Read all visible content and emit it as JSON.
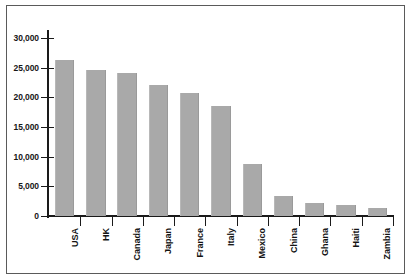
{
  "chart_data": {
    "type": "bar",
    "title": "",
    "subtitle": "",
    "xlabel": "",
    "ylabel": "",
    "categories": [
      "USA",
      "HK",
      "Canada",
      "Japan",
      "France",
      "Italy",
      "Mexico",
      "China",
      "Ghana",
      "Haiti",
      "Zambia"
    ],
    "values": [
      26300,
      24600,
      24100,
      22100,
      20700,
      18500,
      8800,
      3400,
      2200,
      1800,
      1400
    ],
    "series": [
      {
        "name": "",
        "values": [
          26300,
          24600,
          24100,
          22100,
          20700,
          18500,
          8800,
          3400,
          2200,
          1800,
          1400
        ]
      }
    ],
    "ylim": [
      0,
      32000
    ],
    "ytick_values": [
      0,
      5000,
      10000,
      15000,
      20000,
      25000,
      30000
    ],
    "ytick_labels": [
      "0",
      "5,000",
      "10,000",
      "15,000",
      "20,000",
      "25,000",
      "30,000"
    ],
    "grid": false,
    "legend": false,
    "legend_position": "none",
    "bar_color": "#a9a9a9",
    "axis_color": "#1a1a1a",
    "background_color": "#ffffff",
    "xtick_label_rotation": 90,
    "annotations": []
  }
}
